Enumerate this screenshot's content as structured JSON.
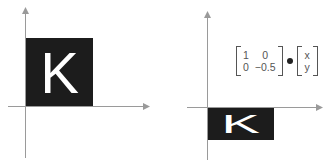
{
  "left_panel": {
    "caption": "original",
    "letter": "K",
    "square": {
      "x": 26,
      "y": 38,
      "width": 67,
      "height": 68,
      "fill": "#1c1c1c"
    }
  },
  "right_panel": {
    "caption": "transformed",
    "letter": "K",
    "rect": {
      "x": 207,
      "y": 107,
      "width": 67,
      "height": 33,
      "fill": "#1c1c1c"
    },
    "matrix": {
      "a11": "1",
      "a12": "0",
      "a21": "0",
      "a22": "−0.5"
    },
    "operator": "•",
    "vector": {
      "v1": "x",
      "v2": "y"
    }
  },
  "colors": {
    "axis": "#9a9a9a",
    "fill": "#1c1c1c",
    "letter": "#ffffff",
    "text": "#555555"
  }
}
